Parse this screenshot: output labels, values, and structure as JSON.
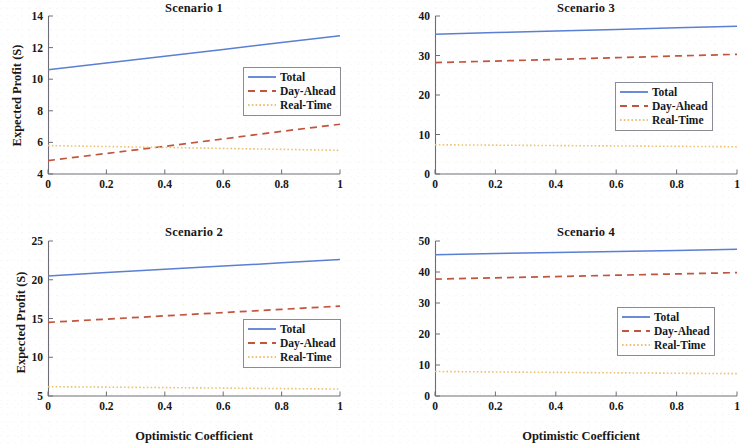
{
  "figure": {
    "rows": 2,
    "cols": 2,
    "background": "#ffffff",
    "shared_xlabel": "Optimistic Coefficient",
    "shared_ylabel": "Expected Profit (S)"
  },
  "colors": {
    "total": "#5B7FD4",
    "day_ahead": "#C1553E",
    "real_time": "#EDC373",
    "axis": "#6E6E78",
    "text": "#171717"
  },
  "legend": {
    "entries": [
      {
        "label": "Total",
        "style": "solid",
        "color": "#5B7FD4"
      },
      {
        "label": "Day-Ahead",
        "style": "dashed",
        "color": "#C1553E"
      },
      {
        "label": "Real-Time",
        "style": "dotted",
        "color": "#EDC373"
      }
    ]
  },
  "chart_data": [
    {
      "type": "line",
      "title": "Scenario 1",
      "xlabel": "",
      "ylabel": "Expected Profit (S)",
      "x": [
        0,
        0.2,
        0.4,
        0.6,
        0.8,
        1
      ],
      "xlim": [
        0,
        1
      ],
      "ylim": [
        4,
        14
      ],
      "xticks": [
        0,
        0.2,
        0.4,
        0.6,
        0.8,
        1
      ],
      "xticklabels": [
        "0",
        "0.2",
        "0.4",
        "0.6",
        "0.8",
        "1"
      ],
      "yticks": [
        4,
        6,
        8,
        10,
        12,
        14
      ],
      "yticklabels": [
        "4",
        "6",
        "8",
        "10",
        "12",
        "14"
      ],
      "grid": false,
      "legend_position": "center-right",
      "series": [
        {
          "name": "Total",
          "values": [
            10.6,
            11.02,
            11.45,
            11.88,
            12.32,
            12.75
          ]
        },
        {
          "name": "Day-Ahead",
          "values": [
            4.85,
            5.3,
            5.75,
            6.22,
            6.7,
            7.15
          ]
        },
        {
          "name": "Real-Time",
          "values": [
            5.8,
            5.74,
            5.68,
            5.62,
            5.56,
            5.5
          ]
        }
      ]
    },
    {
      "type": "line",
      "title": "Scenario 3",
      "xlabel": "",
      "ylabel": "",
      "x": [
        0,
        0.2,
        0.4,
        0.6,
        0.8,
        1
      ],
      "xlim": [
        0,
        1
      ],
      "ylim": [
        0,
        40
      ],
      "xticks": [
        0,
        0.2,
        0.4,
        0.6,
        0.8,
        1
      ],
      "xticklabels": [
        "0",
        "0.2",
        "0.4",
        "0.6",
        "0.8",
        "1"
      ],
      "yticks": [
        0,
        10,
        20,
        30,
        40
      ],
      "yticklabels": [
        "0",
        "10",
        "20",
        "30",
        "40"
      ],
      "grid": false,
      "legend_position": "center-right",
      "series": [
        {
          "name": "Total",
          "values": [
            35.4,
            35.8,
            36.2,
            36.6,
            37.0,
            37.4
          ]
        },
        {
          "name": "Day-Ahead",
          "values": [
            28.2,
            28.6,
            29.0,
            29.45,
            29.88,
            30.3
          ]
        },
        {
          "name": "Real-Time",
          "values": [
            7.4,
            7.3,
            7.2,
            7.1,
            7.0,
            6.9
          ]
        }
      ]
    },
    {
      "type": "line",
      "title": "Scenario 2",
      "xlabel": "Optimistic Coefficient",
      "ylabel": "Expected Profit (S)",
      "x": [
        0,
        0.2,
        0.4,
        0.6,
        0.8,
        1
      ],
      "xlim": [
        0,
        1
      ],
      "ylim": [
        5,
        25
      ],
      "xticks": [
        0,
        0.2,
        0.4,
        0.6,
        0.8,
        1
      ],
      "xticklabels": [
        "0",
        "0.2",
        "0.4",
        "0.6",
        "0.8",
        "1"
      ],
      "yticks": [
        5,
        10,
        15,
        20,
        25
      ],
      "yticklabels": [
        "5",
        "10",
        "15",
        "20",
        "25"
      ],
      "grid": false,
      "legend_position": "lower-right",
      "series": [
        {
          "name": "Total",
          "values": [
            20.5,
            20.92,
            21.34,
            21.76,
            22.18,
            22.6
          ]
        },
        {
          "name": "Day-Ahead",
          "values": [
            14.5,
            14.92,
            15.34,
            15.76,
            16.18,
            16.6
          ]
        },
        {
          "name": "Real-Time",
          "values": [
            6.2,
            6.14,
            6.08,
            6.02,
            5.96,
            5.9
          ]
        }
      ]
    },
    {
      "type": "line",
      "title": "Scenario 4",
      "xlabel": "Optimistic Coefficient",
      "ylabel": "",
      "x": [
        0,
        0.2,
        0.4,
        0.6,
        0.8,
        1
      ],
      "xlim": [
        0,
        1
      ],
      "ylim": [
        0,
        50
      ],
      "xticks": [
        0,
        0.2,
        0.4,
        0.6,
        0.8,
        1
      ],
      "xticklabels": [
        "0",
        "0.2",
        "0.4",
        "0.6",
        "0.8",
        "1"
      ],
      "yticks": [
        0,
        10,
        20,
        30,
        40,
        50
      ],
      "yticklabels": [
        "0",
        "10",
        "20",
        "30",
        "40",
        "50"
      ],
      "grid": false,
      "legend_position": "center-right",
      "series": [
        {
          "name": "Total",
          "values": [
            45.6,
            45.94,
            46.28,
            46.62,
            46.96,
            47.3
          ]
        },
        {
          "name": "Day-Ahead",
          "values": [
            37.7,
            38.12,
            38.54,
            38.96,
            39.38,
            39.8
          ]
        },
        {
          "name": "Real-Time",
          "values": [
            7.9,
            7.76,
            7.62,
            7.48,
            7.34,
            7.2
          ]
        }
      ]
    }
  ]
}
